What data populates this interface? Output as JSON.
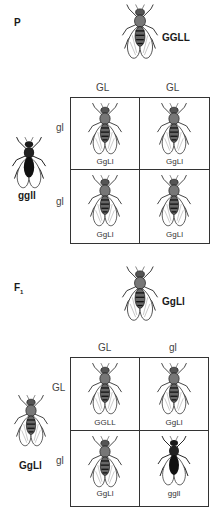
{
  "parental": {
    "generation_label": "P",
    "top_parent_genotype": "GGLL",
    "left_parent_genotype": "ggll",
    "column_gametes": [
      "GL",
      "GL"
    ],
    "row_gametes": [
      "gl",
      "gl"
    ],
    "cells": [
      {
        "genotype": "GgLl",
        "phenotype": "wild"
      },
      {
        "genotype": "GgLl",
        "phenotype": "wild"
      },
      {
        "genotype": "GgLl",
        "phenotype": "wild"
      },
      {
        "genotype": "GgLl",
        "phenotype": "wild"
      }
    ]
  },
  "f1": {
    "generation_label": "F",
    "generation_subscript": "1",
    "top_parent_genotype": "GgLl",
    "left_parent_genotype": "GgLl",
    "column_gametes": [
      "GL",
      "gl"
    ],
    "row_gametes": [
      "GL",
      "gl"
    ],
    "cells": [
      {
        "genotype": "GGLL",
        "phenotype": "wild"
      },
      {
        "genotype": "GgLl",
        "phenotype": "wild"
      },
      {
        "genotype": "GgLl",
        "phenotype": "wild"
      },
      {
        "genotype": "ggll",
        "phenotype": "dark"
      }
    ]
  },
  "colors": {
    "grid_line": "#333333",
    "wild_body": "#6a6a6a",
    "dark_body": "#1a1a1a",
    "wing": "#ffffff"
  }
}
